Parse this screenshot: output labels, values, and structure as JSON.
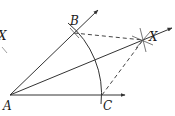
{
  "diagram": {
    "colors": {
      "stroke": "#333333",
      "label": "#1a1a1a",
      "background": "#ffffff"
    },
    "points": {
      "A": {
        "label": "A",
        "x": 10,
        "y": 95
      },
      "B": {
        "label": "B",
        "x": 74,
        "y": 33
      },
      "C": {
        "label": "C",
        "x": 102,
        "y": 95
      },
      "X": {
        "label": "X",
        "x": 143,
        "y": 40
      },
      "X_left": {
        "label": "X",
        "x": 4,
        "y": 37
      }
    },
    "rays": [
      {
        "name": "ray-AB",
        "from": "A",
        "to": [
          98,
          10
        ],
        "arrow": true
      },
      {
        "name": "ray-AC",
        "from": "A",
        "to": [
          125,
          95
        ],
        "arrow": true
      },
      {
        "name": "ray-AX",
        "from": "A",
        "to": [
          172,
          28
        ],
        "arrow": true
      }
    ],
    "dashed_segments": [
      {
        "name": "segment-BX",
        "from": "B",
        "to": "X"
      },
      {
        "name": "segment-CX",
        "from": "C",
        "to": "X"
      }
    ],
    "arcs": [
      {
        "name": "arc-BC",
        "center": "A",
        "through": [
          "B",
          "C"
        ]
      }
    ]
  }
}
